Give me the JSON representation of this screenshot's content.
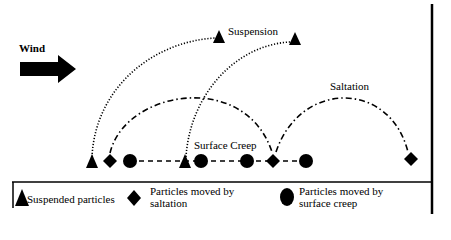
{
  "diagram": {
    "labels": {
      "wind": "Wind",
      "suspension": "Suspension",
      "saltation": "Saltation",
      "surface_creep": "Surface Creep"
    },
    "legend": {
      "suspended": "Suspended particles",
      "saltation_line1": "Particles moved by",
      "saltation_line2": "saltation",
      "creep_line1": "Particles moved by",
      "creep_line2": "surface creep"
    },
    "symbols": {
      "suspended": "triangle",
      "saltation": "diamond",
      "surface_creep": "circle"
    },
    "colors": {
      "ink": "#000000",
      "background": "#ffffff"
    }
  }
}
